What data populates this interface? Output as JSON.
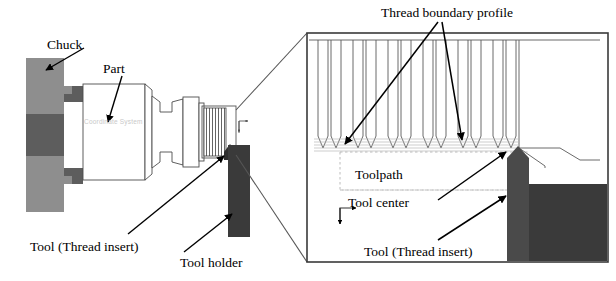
{
  "figure": {
    "background_color": "#ffffff",
    "line_color": "#000000"
  },
  "labels": {
    "chuck": "Chuck",
    "part": "Part",
    "tool_thread_insert_left": "Tool (Thread insert)",
    "tool_holder": "Tool holder",
    "thread_boundary_profile": "Thread boundary profile",
    "toolpath": "Toolpath",
    "tool_center": "Tool center",
    "tool_thread_insert_right": "Tool (Thread insert)",
    "coordinate_system": "Coordinate System"
  },
  "colors": {
    "chuck_light_gray": "#8e8e8e",
    "chuck_dark_gray": "#5d5d5d",
    "tool_dark": "#4a4a4a",
    "tool_holder_dark": "#3a3a3a",
    "outline": "#4d4d4d",
    "faint_gray": "#c9c9c9",
    "toolpath_gray": "#b0b0b0"
  },
  "left_view": {
    "name": "overall-lathe-setup",
    "components": [
      {
        "name": "chuck",
        "label": "Chuck",
        "fill": "#8e8e8e"
      },
      {
        "name": "part",
        "label": "Part",
        "fill": "#ffffff"
      },
      {
        "name": "thread-region",
        "label": "threaded section"
      },
      {
        "name": "tool-insert",
        "label": "Tool (Thread insert)",
        "fill": "#4a4a4a"
      },
      {
        "name": "tool-holder",
        "label": "Tool holder",
        "fill": "#3a3a3a"
      },
      {
        "name": "coordinate-axes",
        "label": "Coordinate System"
      }
    ]
  },
  "right_view": {
    "name": "magnified-thread-detail",
    "components": [
      {
        "name": "thread-boundary-profile",
        "label": "Thread boundary profile"
      },
      {
        "name": "toolpath",
        "label": "Toolpath"
      },
      {
        "name": "tool-center",
        "label": "Tool center"
      },
      {
        "name": "tool-insert",
        "label": "Tool (Thread insert)",
        "fill": "#4a4a4a"
      },
      {
        "name": "tool-holder-block",
        "fill": "#3a3a3a"
      },
      {
        "name": "coordinate-axes",
        "label": "coordinate axes icon"
      }
    ],
    "thread_groove_count": 9
  }
}
